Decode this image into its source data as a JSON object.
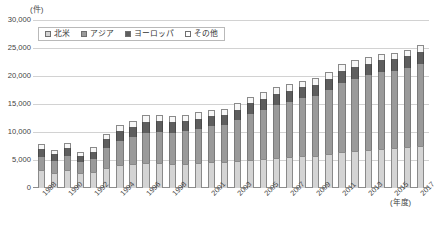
{
  "chart_data": {
    "type": "bar",
    "stacked": true,
    "title": "",
    "xlabel": "(年度)",
    "ylabel": "(件)",
    "ylim": [
      0,
      30000
    ],
    "ytick_values": [
      30000,
      25000,
      20000,
      15000,
      10000,
      5000,
      0
    ],
    "ytick_labels": [
      "30,000",
      "25,000",
      "20,000",
      "15,000",
      "10,000",
      "5,000",
      "0"
    ],
    "grid": true,
    "legend_position": "top-left",
    "categories": [
      "1988",
      "1989",
      "1990",
      "1991",
      "1992",
      "1993",
      "1994",
      "1995",
      "1996",
      "1997",
      "1998",
      "1999",
      "2000",
      "2001",
      "2002",
      "2003",
      "2004",
      "2005",
      "2006",
      "2007",
      "2008",
      "2009",
      "2010",
      "2011",
      "2012",
      "2013",
      "2014",
      "2015",
      "2016",
      "2017"
    ],
    "visible_tick_labels": [
      "1988",
      "",
      "1990",
      "",
      "1992",
      "",
      "1994",
      "",
      "1996",
      "",
      "1998",
      "",
      "",
      "2001",
      "",
      "2003",
      "",
      "2005",
      "",
      "2007",
      "",
      "2009",
      "",
      "2011",
      "",
      "2013",
      "",
      "2015",
      "",
      "2017"
    ],
    "series": [
      {
        "name": "北米",
        "color": "#d4d4d4",
        "values": [
          3200,
          2700,
          3300,
          2600,
          2800,
          3600,
          4100,
          4300,
          4500,
          4400,
          4300,
          4300,
          4500,
          4600,
          4600,
          4800,
          5000,
          5200,
          5400,
          5600,
          5700,
          5800,
          6100,
          6400,
          6600,
          6800,
          7000,
          7100,
          7300,
          7500
        ]
      },
      {
        "name": "アジア",
        "color": "#9a9a9a",
        "values": [
          2400,
          2200,
          2500,
          2100,
          2400,
          3500,
          4300,
          4800,
          5400,
          5600,
          5600,
          5800,
          6100,
          6500,
          6700,
          7300,
          8200,
          8700,
          9400,
          9800,
          10300,
          10600,
          11400,
          12400,
          12900,
          13300,
          13700,
          13800,
          14100,
          14600
        ]
      },
      {
        "name": "ヨーロッパ",
        "color": "#5e5e5e",
        "values": [
          1300,
          1100,
          1400,
          1100,
          1300,
          1600,
          1700,
          1800,
          1900,
          1900,
          1800,
          1800,
          1800,
          1800,
          1800,
          1900,
          1900,
          2000,
          2000,
          2000,
          2000,
          2000,
          2000,
          2100,
          2100,
          2100,
          2100,
          2100,
          2100,
          2200
        ]
      },
      {
        "name": "その他",
        "color": "#ffffff",
        "values": [
          900,
          800,
          900,
          700,
          800,
          1000,
          1100,
          1100,
          1200,
          1200,
          1100,
          1100,
          1100,
          1100,
          1100,
          1200,
          1200,
          1200,
          1200,
          1200,
          1200,
          1200,
          1200,
          1200,
          1200,
          1200,
          1200,
          1200,
          1200,
          1200
        ]
      }
    ],
    "totals": [
      7800,
      6800,
      8100,
      6500,
      7300,
      9700,
      11200,
      12000,
      13000,
      13100,
      12800,
      13000,
      13500,
      14000,
      14200,
      15200,
      16300,
      17100,
      18000,
      18600,
      19200,
      19600,
      20700,
      22100,
      22800,
      23400,
      24000,
      24200,
      24700,
      25500
    ]
  },
  "legend": {
    "items": [
      {
        "label": "北米",
        "swatch": "sw-na"
      },
      {
        "label": "アジア",
        "swatch": "sw-asia"
      },
      {
        "label": "ヨーロッパ",
        "swatch": "sw-eu"
      },
      {
        "label": "その他",
        "swatch": "sw-other"
      }
    ]
  }
}
